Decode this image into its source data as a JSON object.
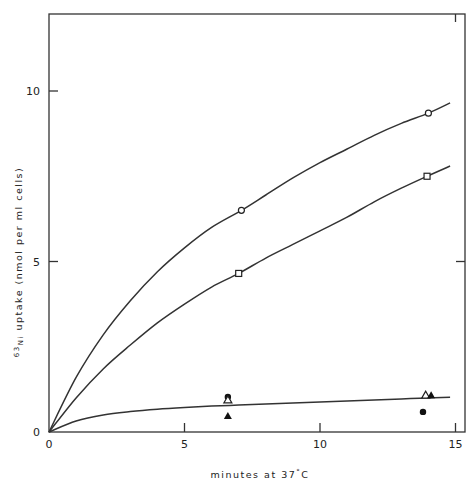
{
  "chart_data": {
    "type": "scatter",
    "title": "",
    "xlabel": "minutes at 37°C",
    "ylabel": "63Ni uptake (nmol per ml cells)",
    "ylabel_parts": {
      "superscript": "63",
      "element": "Ni",
      "rest": " uptake   (nmol  per  ml  cells)"
    },
    "xlabel_parts": {
      "text": "minutes  at  ",
      "temp": "37",
      "deg": "°",
      "unit": "C"
    },
    "xlim": [
      0,
      15
    ],
    "ylim": [
      0,
      12.5
    ],
    "xticks": [
      0,
      5,
      10,
      15
    ],
    "xtick_labels": [
      "0",
      "5",
      "10",
      "15"
    ],
    "yticks": [
      0,
      5,
      10
    ],
    "ytick_labels": [
      "0",
      "5",
      "10"
    ],
    "grid": false,
    "legend": null,
    "series": [
      {
        "name": "open circles",
        "marker": "open-circle",
        "x": [
          0,
          7.1,
          14.0
        ],
        "y": [
          0,
          6.5,
          9.35
        ],
        "fit_curve": [
          [
            0,
            0
          ],
          [
            1,
            1.6
          ],
          [
            2,
            2.85
          ],
          [
            3,
            3.85
          ],
          [
            4,
            4.7
          ],
          [
            5,
            5.4
          ],
          [
            6,
            6.0
          ],
          [
            7.1,
            6.5
          ],
          [
            8,
            6.95
          ],
          [
            9,
            7.45
          ],
          [
            10,
            7.9
          ],
          [
            11,
            8.3
          ],
          [
            12,
            8.7
          ],
          [
            13,
            9.05
          ],
          [
            14,
            9.35
          ],
          [
            14.8,
            9.65
          ]
        ]
      },
      {
        "name": "open squares",
        "marker": "open-square",
        "x": [
          0,
          7.0,
          13.95
        ],
        "y": [
          0,
          4.65,
          7.5
        ],
        "fit_curve": [
          [
            0,
            0
          ],
          [
            1,
            1.0
          ],
          [
            2,
            1.85
          ],
          [
            3,
            2.55
          ],
          [
            4,
            3.2
          ],
          [
            5,
            3.75
          ],
          [
            6,
            4.25
          ],
          [
            7,
            4.65
          ],
          [
            8,
            5.1
          ],
          [
            9,
            5.5
          ],
          [
            10,
            5.9
          ],
          [
            11,
            6.3
          ],
          [
            12,
            6.75
          ],
          [
            13,
            7.15
          ],
          [
            13.95,
            7.5
          ],
          [
            14.8,
            7.8
          ]
        ]
      },
      {
        "name": "filled circles",
        "marker": "filled-circle",
        "x": [
          6.6,
          13.8
        ],
        "y": [
          1.03,
          0.59
        ]
      },
      {
        "name": "open triangles",
        "marker": "open-triangle",
        "x": [
          6.6,
          13.9
        ],
        "y": [
          0.94,
          1.08
        ]
      },
      {
        "name": "filled triangles",
        "marker": "filled-triangle",
        "x": [
          6.6,
          14.1
        ],
        "y": [
          0.47,
          1.08
        ]
      },
      {
        "name": "lower fit",
        "marker": "none",
        "fit_curve": [
          [
            0,
            0
          ],
          [
            1,
            0.32
          ],
          [
            2,
            0.5
          ],
          [
            3,
            0.6
          ],
          [
            4,
            0.67
          ],
          [
            5,
            0.72
          ],
          [
            6,
            0.76
          ],
          [
            7,
            0.79
          ],
          [
            8,
            0.82
          ],
          [
            9,
            0.85
          ],
          [
            10,
            0.88
          ],
          [
            11,
            0.91
          ],
          [
            12,
            0.94
          ],
          [
            13,
            0.97
          ],
          [
            14,
            1.0
          ],
          [
            14.8,
            1.02
          ]
        ]
      }
    ]
  }
}
